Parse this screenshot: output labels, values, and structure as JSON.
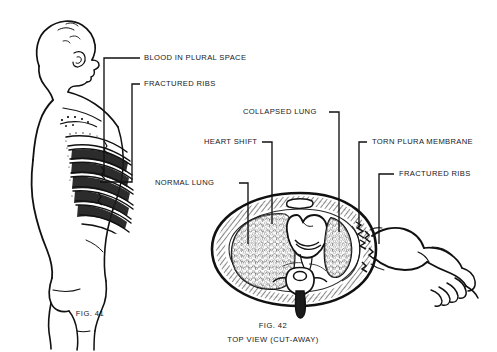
{
  "figure": {
    "background_color": "#ffffff",
    "ink_color": "#111111"
  },
  "labels": {
    "blood_in_plural_space": "BLOOD IN PLURAL SPACE",
    "fractured_ribs_left": "FRACTURED RIBS",
    "collapsed_lung": "COLLAPSED LUNG",
    "heart_shift": "HEART SHIFT",
    "torn_plura_membrane": "TORN PLURA MEMBRANE",
    "fractured_ribs_right": "FRACTURED RIBS",
    "normal_lung": "NORMAL LUNG"
  },
  "captions": {
    "fig41": "FIG. 41",
    "fig42": "FIG. 42",
    "fig42_sub": "TOP VIEW (CUT-AWAY)"
  },
  "left_figure": {
    "name": "side-view-torso",
    "description": "Side view of a human torso from behind showing fractured ribs and blood in the pleural space"
  },
  "right_figure": {
    "name": "thorax-cross-section",
    "description": "Top view cut-away of the thorax showing normal lung, heart shift, collapsed lung, torn pleura and fractured ribs, with the arm at right"
  }
}
